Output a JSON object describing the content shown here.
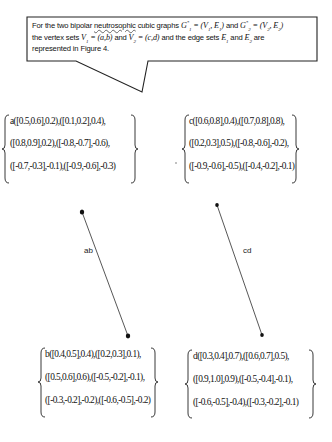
{
  "callout": {
    "line1_pre": "For the two bipolar ",
    "line1_underlined": "neutrosophic",
    "line1_post": " cubic graphs ",
    "g1": "G",
    "g1_sub": "1",
    "g1_sup": "*",
    "g1_def": " = (V",
    "g1_def_sub1": "1",
    "g1_def_mid": ", E",
    "g1_def_sub2": "1",
    "g1_def_end": ")",
    "and1": " and ",
    "g2": "G",
    "g2_sub": "2",
    "g2_sup": "*",
    "g2_def": " = (V",
    "g2_def_sub1": "2",
    "g2_def_mid": ", E",
    "g2_def_sub2": "2",
    "g2_def_end": ")",
    "line2_pre": "the vertex sets ",
    "v1": "V",
    "v1_sub": "1",
    "v1_def": " = (a,b)",
    "and2": " and ",
    "v2": "V",
    "v2_sub": "2",
    "v2_def": " = (c,d)",
    "line2_mid": " and the edge sets ",
    "e1": "E",
    "e1_sub": "1",
    "and3": " and ",
    "e2": "E",
    "e2_sub": "2",
    "line2_post": " are",
    "line3": "represented in Figure 4."
  },
  "vertices": {
    "a": {
      "rows": [
        "a([0.5,0.6],0.2),([0.1,0.2],0.4),",
        "([0.8,0.9],0.2),([-0.8,-0.7],-0.6),",
        "([-0.7,-0.3],-0.1),([-0.9,-0.6],-0.3)"
      ]
    },
    "c": {
      "rows": [
        "c([0.6,0.8],0.4),([0.7,0.8],0.8),",
        "([0.2,0.3],0.5),([-0.8,-0.6],-0.2),",
        "([-0.9,-0.6],-0.5),([-0.4,-0.2],-0.1)"
      ]
    },
    "b": {
      "rows": [
        "b([0.4,0.5],0.4),([0.2,0.3],0.1),",
        "([0.5,0.6],0.6),([-0.5,-0.2],-0.1),",
        "([-0.3,-0.2],-0.2),([-0.6,-0.5],-0.2)"
      ]
    },
    "d": {
      "rows": [
        "d([0.3,0.4],0.7),([0.6,0.7],0.5),",
        "([0.9,1.0],0.9),([-0.5,-0.4],-0.1),",
        "([-0.6,-0.5],-0.4),([-0.3,-0.2],-0.1)"
      ]
    }
  },
  "edges": [
    {
      "label": "ab",
      "from": "a",
      "to": "b"
    },
    {
      "label": "cd",
      "from": "c",
      "to": "d"
    }
  ],
  "colors": {
    "stroke": "#222222",
    "edge": "#333333",
    "background": "#ffffff"
  }
}
